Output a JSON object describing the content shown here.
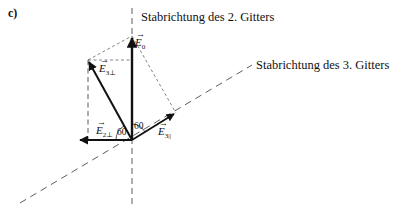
{
  "part_label": "c)",
  "axes": {
    "grid2": {
      "label": "Stabrichtung des 2. Gitters"
    },
    "grid3": {
      "label": "Stabrichtung des 3. Gitters"
    }
  },
  "vectors": {
    "E0": {
      "symbol": "E",
      "sub": "0"
    },
    "E3perp": {
      "symbol": "E",
      "sub": "3⊥"
    },
    "E2perp": {
      "symbol": "E",
      "sub": "2⊥"
    },
    "E3par": {
      "symbol": "E",
      "sub": "3||"
    }
  },
  "angles": {
    "left": "60",
    "right": "60"
  },
  "colors": {
    "ink": "#111111",
    "dash": "#333333"
  }
}
